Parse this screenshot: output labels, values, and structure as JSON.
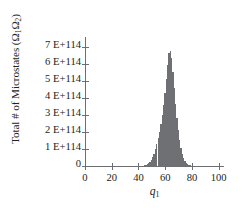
{
  "chart_data": {
    "type": "bar",
    "title": "",
    "xlabel": "q1",
    "ylabel": "Total # of Microstates (Ω₁Ω₂)",
    "ylabel_prefix": "Total # of Microstates (Ω",
    "ylabel_sub1": "1",
    "ylabel_mid": "Ω",
    "ylabel_sub2": "2",
    "ylabel_suffix": ")",
    "xlabel_base": "q",
    "xlabel_sub": "1",
    "xlim": [
      0,
      104
    ],
    "ylim": [
      0,
      7.6
    ],
    "y_unit": "E+114",
    "grid": false,
    "legend": false,
    "bar_color": "#6f7073",
    "axis_color": "#6d6e71",
    "xticks": [
      0,
      20,
      40,
      60,
      80,
      100
    ],
    "xtick_labels": [
      "0",
      "20",
      "40",
      "60",
      "80",
      "100"
    ],
    "yticks": [
      0,
      1,
      2,
      3,
      4,
      5,
      6,
      7
    ],
    "ytick_labels": [
      "0",
      "1 E+114",
      "2 E+114",
      "3 E+114",
      "4 E+114",
      "5 E+114",
      "6 E+114",
      "7 E+114"
    ],
    "categories": [
      40,
      41,
      42,
      43,
      44,
      45,
      46,
      47,
      48,
      49,
      50,
      51,
      52,
      53,
      54,
      55,
      56,
      57,
      58,
      59,
      60,
      61,
      62,
      63,
      64,
      65,
      66,
      67,
      68,
      69,
      70,
      71,
      72,
      73,
      74,
      75,
      76,
      77,
      78,
      79,
      80,
      81,
      82
    ],
    "values": [
      0.002,
      0.004,
      0.009,
      0.018,
      0.033,
      0.058,
      0.098,
      0.158,
      0.245,
      0.365,
      0.525,
      0.73,
      0.98,
      1.28,
      1.63,
      2.03,
      2.48,
      3.0,
      3.6,
      4.3,
      5.1,
      5.95,
      6.65,
      6.8,
      6.35,
      5.55,
      4.6,
      3.65,
      2.8,
      2.1,
      1.52,
      1.06,
      0.72,
      0.47,
      0.3,
      0.185,
      0.11,
      0.064,
      0.036,
      0.02,
      0.011,
      0.006,
      0.003
    ],
    "peak_x": 63,
    "peak_y": 6.8,
    "distribution_range": [
      42,
      80
    ]
  }
}
